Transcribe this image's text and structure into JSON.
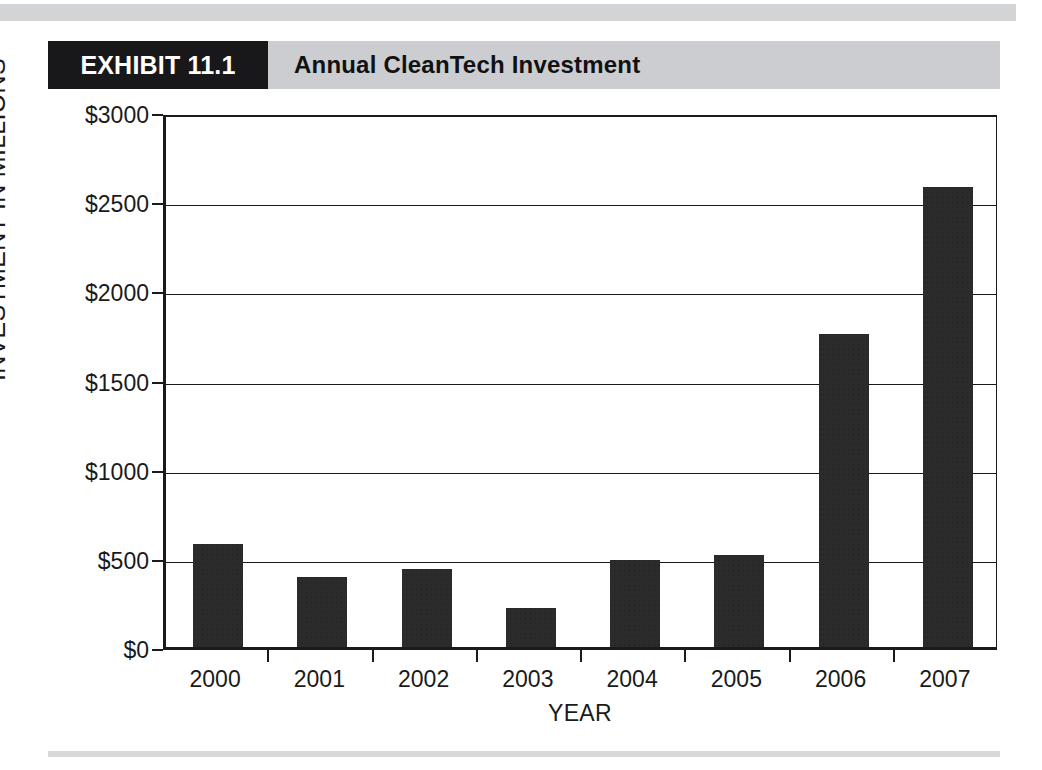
{
  "exhibit": {
    "tag": "EXHIBIT 11.1",
    "title": "Annual CleanTech Investment"
  },
  "colors": {
    "bar": "#2b2b2b",
    "header_band": "#cbcdd0",
    "tag_background": "#18181a",
    "axis": "#1a1a1a",
    "rule": "#d2d4d6"
  },
  "chart_data": {
    "type": "bar",
    "title": "Annual CleanTech Investment",
    "xlabel": "YEAR",
    "ylabel": "INVESTMENT IN MILLIONS",
    "categories": [
      "2000",
      "2001",
      "2002",
      "2003",
      "2004",
      "2005",
      "2006",
      "2007"
    ],
    "values": [
      575,
      390,
      440,
      220,
      490,
      515,
      1755,
      2580
    ],
    "ylim": [
      0,
      3000
    ],
    "ytick_values": [
      0,
      500,
      1000,
      1500,
      2000,
      2500,
      3000
    ],
    "ytick_labels": [
      "$0",
      "$500",
      "$1000",
      "$1500",
      "$2000",
      "$2500",
      "$3000"
    ],
    "grid": true,
    "legend": null,
    "series": [
      {
        "name": "Annual CleanTech Investment",
        "values": [
          575,
          390,
          440,
          220,
          490,
          515,
          1755,
          2580
        ]
      }
    ]
  }
}
